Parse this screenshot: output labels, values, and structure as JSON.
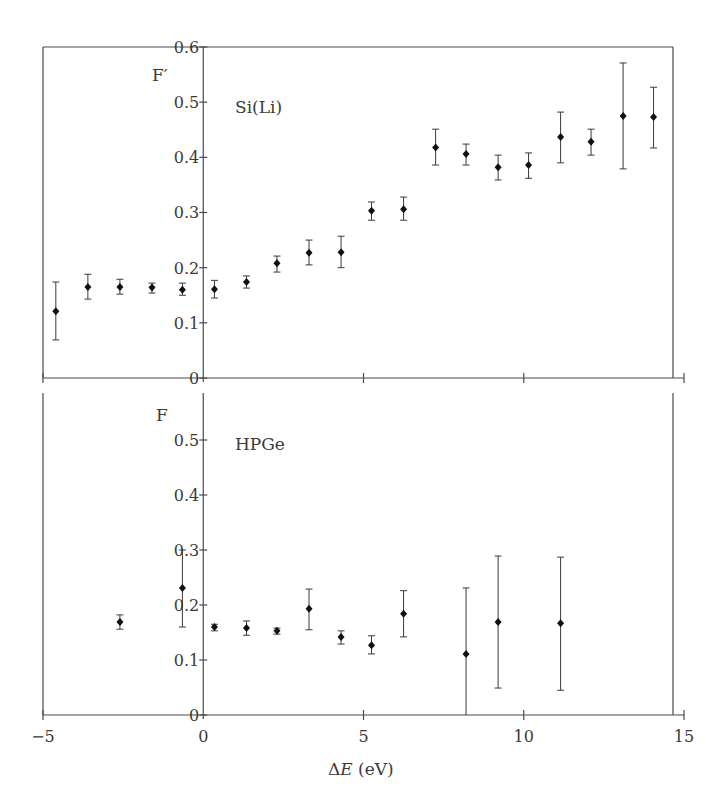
{
  "figure": {
    "x_label": "ΔE (eV)",
    "x_label_prefix": "Δ",
    "x_label_var": "E",
    "x_label_unit": " (eV)",
    "x_ticks": [
      -5,
      0,
      5,
      10,
      15
    ],
    "x_tick_labels": [
      "−5",
      "0",
      "5",
      "10",
      "15"
    ]
  },
  "chart_data": [
    {
      "type": "scatter",
      "title": "Si(Li)",
      "panel": "top",
      "ylabel": "F′",
      "xlabel": "ΔE (eV)",
      "xlim": [
        -5,
        15
      ],
      "ylim": [
        0,
        0.6
      ],
      "y_ticks": [
        0,
        0.1,
        0.2,
        0.3,
        0.4,
        0.5,
        0.6
      ],
      "y_tick_labels": [
        "0",
        "0.1",
        "0.2",
        "0.3",
        "0.4",
        "0.5",
        "0.6"
      ],
      "grid": false,
      "error_bars": true,
      "points": [
        {
          "x": -4.6,
          "y": 0.121,
          "lo": 0.069,
          "hi": 0.174
        },
        {
          "x": -3.6,
          "y": 0.165,
          "lo": 0.143,
          "hi": 0.188
        },
        {
          "x": -2.6,
          "y": 0.165,
          "lo": 0.152,
          "hi": 0.179
        },
        {
          "x": -1.6,
          "y": 0.164,
          "lo": 0.154,
          "hi": 0.172
        },
        {
          "x": -0.65,
          "y": 0.16,
          "lo": 0.15,
          "hi": 0.172
        },
        {
          "x": 0.35,
          "y": 0.161,
          "lo": 0.145,
          "hi": 0.177
        },
        {
          "x": 1.35,
          "y": 0.174,
          "lo": 0.163,
          "hi": 0.185
        },
        {
          "x": 2.3,
          "y": 0.208,
          "lo": 0.192,
          "hi": 0.221
        },
        {
          "x": 3.3,
          "y": 0.227,
          "lo": 0.205,
          "hi": 0.25
        },
        {
          "x": 4.3,
          "y": 0.228,
          "lo": 0.2,
          "hi": 0.257
        },
        {
          "x": 5.25,
          "y": 0.303,
          "lo": 0.286,
          "hi": 0.319
        },
        {
          "x": 6.25,
          "y": 0.306,
          "lo": 0.286,
          "hi": 0.328
        },
        {
          "x": 7.25,
          "y": 0.418,
          "lo": 0.386,
          "hi": 0.451
        },
        {
          "x": 8.2,
          "y": 0.406,
          "lo": 0.386,
          "hi": 0.424
        },
        {
          "x": 9.2,
          "y": 0.382,
          "lo": 0.359,
          "hi": 0.404
        },
        {
          "x": 10.15,
          "y": 0.386,
          "lo": 0.362,
          "hi": 0.408
        },
        {
          "x": 11.15,
          "y": 0.437,
          "lo": 0.39,
          "hi": 0.482
        },
        {
          "x": 12.1,
          "y": 0.428,
          "lo": 0.404,
          "hi": 0.451
        },
        {
          "x": 13.1,
          "y": 0.475,
          "lo": 0.379,
          "hi": 0.571
        },
        {
          "x": 14.05,
          "y": 0.473,
          "lo": 0.417,
          "hi": 0.527
        }
      ]
    },
    {
      "type": "scatter",
      "title": "HPGe",
      "panel": "bottom",
      "ylabel": "F",
      "xlabel": "ΔE (eV)",
      "xlim": [
        -5,
        15
      ],
      "ylim": [
        0,
        0.58
      ],
      "y_ticks": [
        0,
        0.1,
        0.2,
        0.3,
        0.4,
        0.5
      ],
      "y_tick_labels": [
        "0",
        "0.1",
        "0.2",
        "0.3",
        "0.4",
        "0.5"
      ],
      "grid": false,
      "error_bars": true,
      "points": [
        {
          "x": -2.6,
          "y": 0.169,
          "lo": 0.156,
          "hi": 0.182
        },
        {
          "x": -0.65,
          "y": 0.231,
          "lo": 0.16,
          "hi": 0.3
        },
        {
          "x": 0.35,
          "y": 0.16,
          "lo": 0.153,
          "hi": 0.165
        },
        {
          "x": 1.35,
          "y": 0.158,
          "lo": 0.145,
          "hi": 0.171
        },
        {
          "x": 2.3,
          "y": 0.153,
          "lo": 0.147,
          "hi": 0.158
        },
        {
          "x": 3.3,
          "y": 0.193,
          "lo": 0.155,
          "hi": 0.229
        },
        {
          "x": 4.3,
          "y": 0.142,
          "lo": 0.129,
          "hi": 0.153
        },
        {
          "x": 5.25,
          "y": 0.127,
          "lo": 0.111,
          "hi": 0.144
        },
        {
          "x": 6.25,
          "y": 0.184,
          "lo": 0.142,
          "hi": 0.226
        },
        {
          "x": 8.2,
          "y": 0.111,
          "lo": 0.0,
          "hi": 0.231
        },
        {
          "x": 9.2,
          "y": 0.169,
          "lo": 0.049,
          "hi": 0.289
        },
        {
          "x": 11.15,
          "y": 0.167,
          "lo": 0.045,
          "hi": 0.287
        }
      ]
    }
  ]
}
